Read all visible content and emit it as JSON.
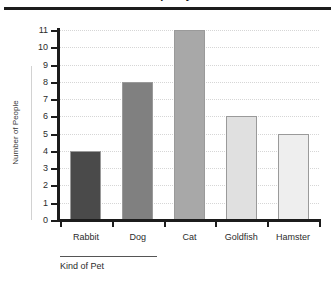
{
  "chart_data": {
    "type": "bar",
    "title": "Number of People by Kind of Pet",
    "xlabel": "Kind of Pet",
    "ylabel": "Number of People",
    "categories": [
      "Rabbit",
      "Dog",
      "Cat",
      "Goldfish",
      "Hamster"
    ],
    "values": [
      4,
      8,
      11,
      6,
      5
    ],
    "ylim": [
      0,
      11
    ],
    "ytick_labels": [
      "0",
      "1",
      "2",
      "3",
      "4",
      "5",
      "6",
      "7",
      "8",
      "9",
      "10",
      "11"
    ],
    "ytick_values": [
      0,
      1,
      2,
      3,
      4,
      5,
      6,
      7,
      8,
      9,
      10,
      11
    ],
    "grid": true,
    "legend": "none",
    "bar_colors": [
      "#4a4a4a",
      "#808080",
      "#a8a8a8",
      "#e0e0e0",
      "#eeeeee"
    ],
    "bar_border_color": "#9a9a9a",
    "axis_color": "#1c1c1c",
    "gridline_color": "#d6d6d6",
    "background": "#ffffff"
  },
  "figure": {
    "title_cropped": "Number of People by Kind of Pet",
    "x_axis_title": "Kind of Pet",
    "y_axis_title": "Number of People"
  }
}
